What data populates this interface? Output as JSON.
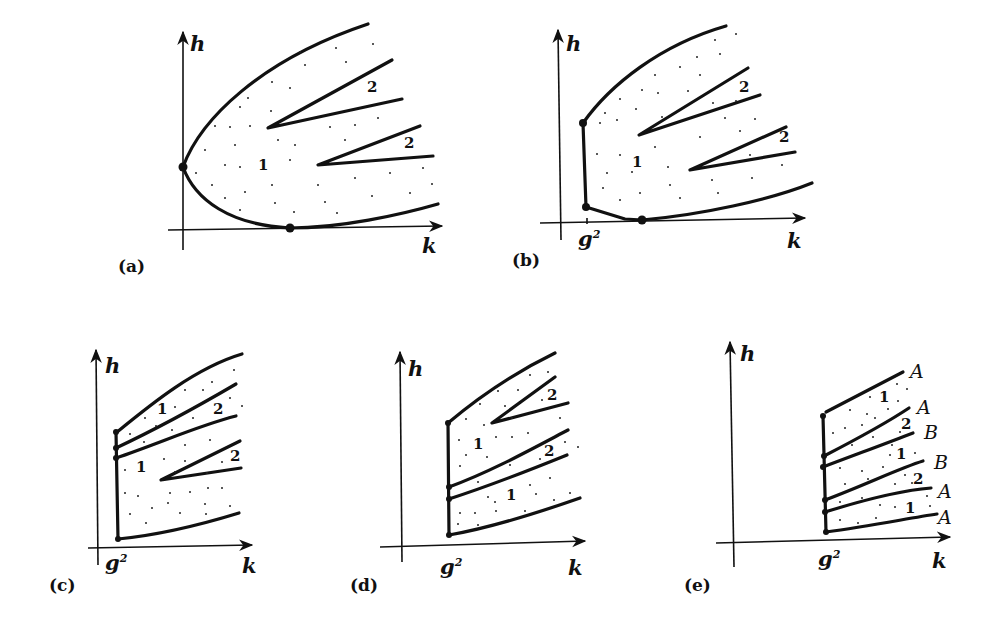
{
  "figure": {
    "panels": [
      {
        "id": "a",
        "caption": "(a)",
        "axis_x": "k",
        "axis_y": "h",
        "region_labels": [
          "1",
          "2",
          "2"
        ]
      },
      {
        "id": "b",
        "caption": "(b)",
        "axis_x": "k",
        "axis_y": "h",
        "tick_label": "g",
        "tick_sup": "2",
        "region_labels": [
          "1",
          "2",
          "2"
        ]
      },
      {
        "id": "c",
        "caption": "(c)",
        "axis_x": "k",
        "axis_y": "h",
        "tick_label": "g",
        "tick_sup": "2",
        "region_labels": [
          "1",
          "2",
          "1",
          "2"
        ]
      },
      {
        "id": "d",
        "caption": "(d)",
        "axis_x": "k",
        "axis_y": "h",
        "tick_label": "g",
        "tick_sup": "2",
        "region_labels": [
          "2",
          "1",
          "2",
          "1"
        ]
      },
      {
        "id": "e",
        "caption": "(e)",
        "axis_x": "k",
        "axis_y": "h",
        "tick_label": "g",
        "tick_sup": "2",
        "region_labels": [
          "1",
          "2",
          "1",
          "2",
          "1"
        ],
        "curve_labels": [
          "A",
          "A",
          "B",
          "B",
          "A",
          "A"
        ]
      }
    ]
  }
}
